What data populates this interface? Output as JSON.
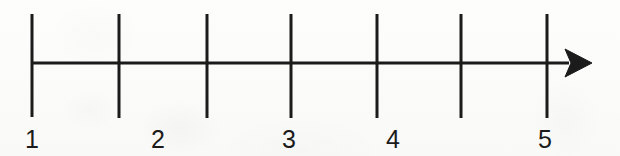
{
  "figure": {
    "kind": "number-line-diagram",
    "background_color": "#fcfcfb",
    "ink_color": "#1b1b1b",
    "width": 620,
    "height": 156
  },
  "axis": {
    "name": "horizontal-number-line",
    "start_x": 32,
    "end_x": 592,
    "y": 63,
    "stroke_width": 3,
    "has_arrowhead_right": true,
    "has_arrowhead_left": false,
    "direction": "right"
  },
  "arrowhead": {
    "name": "right-arrowhead",
    "tip_x": 592,
    "tip_y": 63,
    "back_x": 565,
    "half_height": 14,
    "notch_depth": 6,
    "style": "filled-concave-triangle"
  },
  "ticks": [
    {
      "index": 0,
      "x": 32,
      "top_y": 14,
      "bottom_y": 117,
      "stroke_width": 3,
      "labeled": true,
      "label": "1"
    },
    {
      "index": 1,
      "x": 119,
      "top_y": 14,
      "bottom_y": 118,
      "stroke_width": 3,
      "labeled": false,
      "label": ""
    },
    {
      "index": 2,
      "x": 207,
      "top_y": 14,
      "bottom_y": 118,
      "stroke_width": 3,
      "labeled": true,
      "label": "2"
    },
    {
      "index": 3,
      "x": 291,
      "top_y": 14,
      "bottom_y": 118,
      "stroke_width": 3,
      "labeled": true,
      "label": "3"
    },
    {
      "index": 4,
      "x": 377,
      "top_y": 14,
      "bottom_y": 118,
      "stroke_width": 3,
      "labeled": true,
      "label": "4"
    },
    {
      "index": 5,
      "x": 461,
      "top_y": 14,
      "bottom_y": 118,
      "stroke_width": 3,
      "labeled": false,
      "label": ""
    },
    {
      "index": 6,
      "x": 547,
      "top_y": 14,
      "bottom_y": 118,
      "stroke_width": 3,
      "labeled": true,
      "label": "5"
    }
  ],
  "labels": [
    {
      "text": "1",
      "center_x": 32,
      "baseline_y": 152,
      "font_size": 25
    },
    {
      "text": "2",
      "center_x": 158,
      "baseline_y": 152,
      "font_size": 25
    },
    {
      "text": "3",
      "center_x": 289,
      "baseline_y": 152,
      "font_size": 25
    },
    {
      "text": "4",
      "center_x": 393,
      "baseline_y": 152,
      "font_size": 25
    },
    {
      "text": "5",
      "center_x": 545,
      "baseline_y": 152,
      "font_size": 25
    }
  ],
  "chart_data": {
    "type": "number-line",
    "title": "",
    "xlabel": "",
    "ylabel": "",
    "tick_positions_px": [
      32,
      119,
      207,
      291,
      377,
      461,
      547
    ],
    "tick_spacing_px": 86,
    "visible_tick_labels": [
      "1",
      "2",
      "3",
      "4",
      "5"
    ],
    "label_positions_px": [
      32,
      158,
      289,
      393,
      545
    ],
    "tick_count": 7,
    "labeled_tick_count": 5,
    "grid": false,
    "legend": "none"
  }
}
